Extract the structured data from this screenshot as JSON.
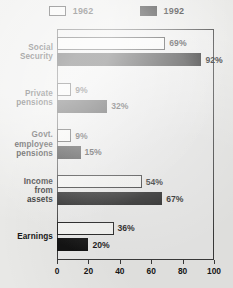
{
  "legend": {
    "entries": [
      {
        "label": "1962",
        "style": "open",
        "swatch_icon": "legend-swatch-open"
      },
      {
        "label": "1992",
        "style": "filled",
        "swatch_icon": "legend-swatch-filled"
      }
    ]
  },
  "axis": {
    "ticks": [
      "0",
      "20",
      "40",
      "60",
      "80",
      "100"
    ]
  },
  "chart_data": {
    "type": "bar",
    "orientation": "horizontal",
    "title": "",
    "subtitle": "",
    "xlabel": "",
    "ylabel": "",
    "xlim": [
      0,
      100
    ],
    "xticks": [
      0,
      20,
      40,
      60,
      80,
      100
    ],
    "grid": false,
    "legend_position": "top-center",
    "categories": [
      "Social Security",
      "Private pensions",
      "Govt. employee pensions",
      "Income from assets",
      "Earnings"
    ],
    "category_lines": [
      [
        "Social",
        "Security"
      ],
      [
        "Private",
        "pensions"
      ],
      [
        "Govt.",
        "employee",
        "pensions"
      ],
      [
        "Income",
        "from",
        "assets"
      ],
      [
        "Earnings"
      ]
    ],
    "series": [
      {
        "name": "1962",
        "style": "open",
        "values": [
          69,
          9,
          9,
          54,
          36
        ],
        "labels": [
          "69%",
          "9%",
          "9%",
          "54%",
          "36%"
        ]
      },
      {
        "name": "1992",
        "style": "filled",
        "values": [
          92,
          32,
          15,
          67,
          20
        ],
        "labels": [
          "92%",
          "32%",
          "15%",
          "67%",
          "20%"
        ]
      }
    ],
    "colors": {
      "open_fill": "#f6f6f4",
      "open_border": "#1d1d1d",
      "filled": "#131313",
      "background": "#e8e8e6",
      "frame": "#3a3a3a"
    }
  }
}
